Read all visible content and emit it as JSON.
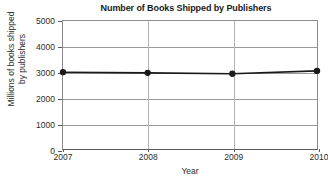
{
  "chart_data": {
    "type": "line",
    "title": "Number of Books Shipped by Publishers",
    "xlabel": "Year",
    "ylabel_lines": [
      "Millions of books shipped",
      "by publishers"
    ],
    "ylabel": "Millions of books shipped by publishers",
    "x": [
      2007,
      2008,
      2009,
      2010
    ],
    "xtick_labels": [
      "2007",
      "2008",
      "2009",
      "2010"
    ],
    "values": [
      3000,
      2975,
      2940,
      3050
    ],
    "series": [
      {
        "name": "Books shipped",
        "values": [
          3000,
          2975,
          2940,
          3050
        ]
      }
    ],
    "ylim": [
      0,
      5000
    ],
    "xlim": [
      2007,
      2010
    ],
    "yticks": [
      0,
      1000,
      2000,
      3000,
      4000,
      5000
    ],
    "ytick_labels": [
      "0",
      "1000",
      "2000",
      "3000",
      "4000",
      "5000"
    ],
    "grid": "horizontal-and-vertical",
    "legend": "none",
    "marker": "filled-circle",
    "line_color": "#1a1a1a",
    "marker_color": "#1a1a1a",
    "grid_color": "#9a9a9a",
    "axis_color": "#5a5a5a",
    "background_color": "#ffffff"
  }
}
